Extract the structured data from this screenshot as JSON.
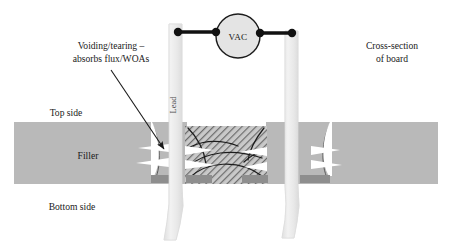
{
  "figure": {
    "title_alt": "Cross-section of board showing voiding/tearing around plated through-hole leads under vacuum",
    "background_color": "#ffffff"
  },
  "labels": {
    "annotation_line1": "Voiding/tearing –",
    "annotation_line2": "absorbs flux/WOAs",
    "cross_section_line1": "Cross-section",
    "cross_section_line2": "of board",
    "top_side": "Top side",
    "bottom_side": "Bottom side",
    "filler": "Filler",
    "vac": "VAC",
    "lead": "Lead"
  },
  "colors": {
    "board_fill": "#b9b9b9",
    "board_edge": "#ababab",
    "pad_fill": "#8e8e8e",
    "lead_fill": "#ececec",
    "lead_edge": "#dedede",
    "hatch_line": "#6f6f6f",
    "hatch_background": "#c6c6c6",
    "void_fill": "#ffffff",
    "flow_line": "#1c1c1c",
    "wire": "#111111",
    "terminal": "#111111",
    "vac_circle_fill": "#e4e4e4",
    "vac_circle_stroke": "#1c1c1c",
    "text": "#1a1a1a",
    "arrow": "#1a1a1a"
  },
  "geometry": {
    "board": {
      "x": 14,
      "y": 122,
      "width": 424,
      "height": 62
    },
    "hatched_region": {
      "x": 185,
      "y": 126,
      "width": 82,
      "height": 58
    },
    "lead_left": {
      "x": 169,
      "top": 24,
      "bottom": 240,
      "width": 13
    },
    "lead_right": {
      "x": 285,
      "top": 31,
      "bottom": 238,
      "width": 13
    },
    "vac_circle": {
      "cx": 238,
      "cy": 36,
      "r": 22
    },
    "terminal_left": {
      "cx": 178,
      "cy": 32,
      "r": 4
    },
    "terminal_right": {
      "cx": 292,
      "cy": 33,
      "r": 4
    },
    "pads": [
      {
        "x": 151,
        "y": 175,
        "width": 30,
        "height": 8
      },
      {
        "x": 186,
        "y": 175,
        "width": 26,
        "height": 8
      },
      {
        "x": 242,
        "y": 175,
        "width": 26,
        "height": 8
      },
      {
        "x": 300,
        "y": 175,
        "width": 30,
        "height": 8
      }
    ]
  },
  "annotation_arrow": {
    "from_x": 111,
    "from_y": 70,
    "to_x": 164,
    "to_y": 149
  },
  "flow_lines_count": 6,
  "void_wedges_count": 8
}
